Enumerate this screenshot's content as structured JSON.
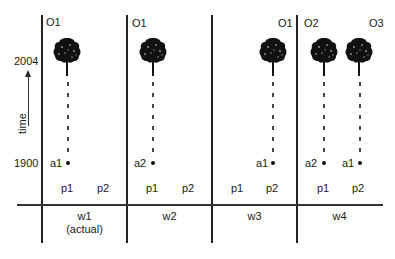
{
  "axis": {
    "top_year": "2004",
    "bottom_year": "1900",
    "time_label": "time"
  },
  "worlds": [
    {
      "label": "w1",
      "sublabel": "(actual)",
      "positions": [
        "p1",
        "p2"
      ],
      "objects": [
        {
          "label": "O1",
          "agent": "a1",
          "position": "p1"
        }
      ]
    },
    {
      "label": "w2",
      "sublabel": "",
      "positions": [
        "p1",
        "p2"
      ],
      "objects": [
        {
          "label": "O1",
          "agent": "a2",
          "position": "p1"
        }
      ]
    },
    {
      "label": "w3",
      "sublabel": "",
      "positions": [
        "p1",
        "p2"
      ],
      "objects": [
        {
          "label": "O1",
          "agent": "a1",
          "position": "p2"
        }
      ]
    },
    {
      "label": "w4",
      "sublabel": "",
      "positions": [
        "p1",
        "p2"
      ],
      "objects": [
        {
          "label": "O2",
          "agent": "a2",
          "position": "p1"
        },
        {
          "label": "O3",
          "agent": "a1",
          "position": "p2"
        }
      ]
    }
  ],
  "icons": {
    "tree": "tree-icon",
    "seed": "dot-icon",
    "arrow": "arrow-up-icon"
  },
  "colors": {
    "ink": "#1a1a1a",
    "background": "#ffffff"
  }
}
